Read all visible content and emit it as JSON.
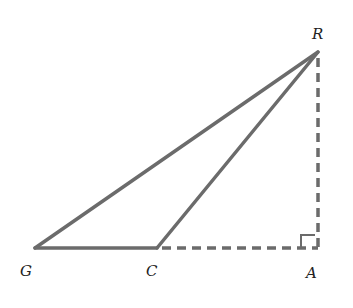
{
  "diagram": {
    "type": "geometry-triangle",
    "points": {
      "R": {
        "label": "R",
        "x": 318,
        "y": 52
      },
      "G": {
        "label": "G",
        "x": 35,
        "y": 248
      },
      "C": {
        "label": "C",
        "x": 157,
        "y": 248
      },
      "A": {
        "label": "A",
        "x": 318,
        "y": 248
      }
    },
    "solid_segments": [
      "GR",
      "CR",
      "GC"
    ],
    "dashed_segments": [
      "CA",
      "RA"
    ],
    "right_angle_at": "A",
    "colors": {
      "line": "#6b6b6b",
      "label": "#222222"
    }
  }
}
